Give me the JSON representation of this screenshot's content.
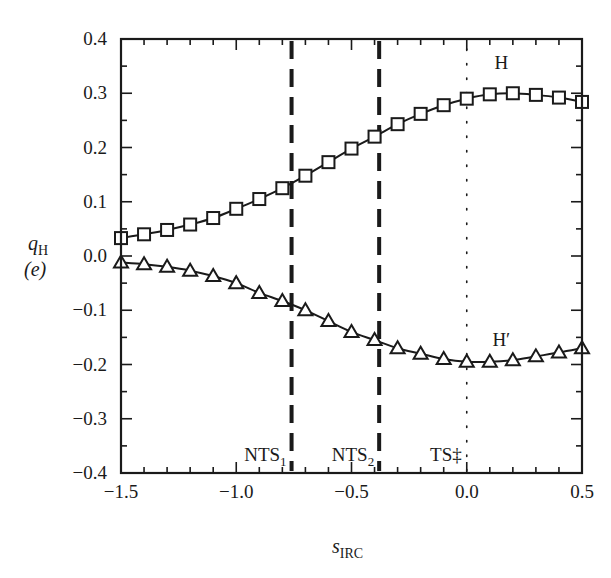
{
  "chart_data": {
    "type": "line",
    "title": "",
    "xlabel": "s_IRC",
    "xlabel_main": "s",
    "xlabel_sub": "IRC",
    "ylabel_main": "q",
    "ylabel_sub": "H",
    "ylabel_unit": "(e)",
    "xlim": [
      -1.5,
      0.5
    ],
    "ylim": [
      -0.4,
      0.4
    ],
    "grid": false,
    "x_ticks": [
      -1.5,
      -1.0,
      -0.5,
      0.0,
      0.5
    ],
    "x_tick_labels": [
      "−1.5",
      "−1.0",
      "−0.5",
      "0.0",
      "0.5"
    ],
    "y_ticks": [
      0.4,
      0.3,
      0.2,
      0.1,
      0.0,
      -0.1,
      -0.2,
      -0.3,
      -0.4
    ],
    "y_tick_labels": [
      "0.4",
      "0.3",
      "0.2",
      "0.1",
      "0.0",
      "−0.1",
      "−0.2",
      "−0.3",
      "−0.4"
    ],
    "x": [
      -1.5,
      -1.4,
      -1.3,
      -1.2,
      -1.1,
      -1.0,
      -0.9,
      -0.8,
      -0.7,
      -0.6,
      -0.5,
      -0.4,
      -0.3,
      -0.2,
      -0.1,
      0.0,
      0.1,
      0.2,
      0.3,
      0.4,
      0.5
    ],
    "series": [
      {
        "name": "H",
        "marker": "square",
        "values": [
          0.033,
          0.04,
          0.048,
          0.058,
          0.07,
          0.087,
          0.105,
          0.125,
          0.148,
          0.173,
          0.198,
          0.22,
          0.243,
          0.262,
          0.278,
          0.29,
          0.298,
          0.3,
          0.297,
          0.292,
          0.284
        ]
      },
      {
        "name": "H′",
        "marker": "triangle",
        "values": [
          -0.012,
          -0.015,
          -0.02,
          -0.027,
          -0.037,
          -0.05,
          -0.068,
          -0.083,
          -0.1,
          -0.12,
          -0.14,
          -0.155,
          -0.17,
          -0.18,
          -0.19,
          -0.195,
          -0.195,
          -0.192,
          -0.185,
          -0.178,
          -0.17
        ]
      }
    ],
    "vertical_lines": [
      {
        "label": "NTS",
        "sub": "1",
        "x": -0.76,
        "style": "dashed"
      },
      {
        "label": "NTS",
        "sub": "2",
        "x": -0.38,
        "style": "dashed"
      },
      {
        "label": "TS‡",
        "sub": "",
        "x": 0.0,
        "style": "dotted"
      }
    ],
    "series_labels": [
      {
        "text": "H",
        "x": 0.15,
        "y": 0.345
      },
      {
        "text": "H′",
        "x": 0.15,
        "y": -0.165
      }
    ]
  }
}
